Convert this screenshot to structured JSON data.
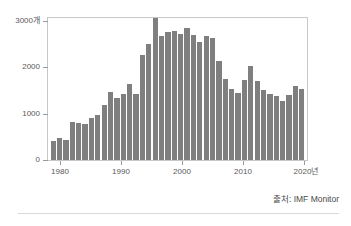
{
  "chart_data": {
    "type": "bar",
    "title": "",
    "subtitle": "",
    "xlabel": "",
    "ylabel": "",
    "y_unit_label": "3000개",
    "x_unit_label": "2020년",
    "ylim": [
      0,
      3000
    ],
    "xlim": [
      1979,
      2020
    ],
    "grid": false,
    "legend": null,
    "bar_color": "#7f7f7f",
    "categories": [
      "1980",
      "1981",
      "1982",
      "1983",
      "1984",
      "1985",
      "1986",
      "1987",
      "1988",
      "1989",
      "1990",
      "1991",
      "1992",
      "1993",
      "1994",
      "1995",
      "1996",
      "1997",
      "1998",
      "1999",
      "2000",
      "2001",
      "2002",
      "2003",
      "2004",
      "2005",
      "2006",
      "2007",
      "2008",
      "2009",
      "2010",
      "2011",
      "2012",
      "2013",
      "2014",
      "2015",
      "2016",
      "2017",
      "2018",
      "2019"
    ],
    "values": [
      400,
      470,
      430,
      800,
      790,
      760,
      880,
      950,
      1160,
      1430,
      1320,
      1400,
      1600,
      1390,
      2220,
      2460,
      2990,
      2620,
      2700,
      2730,
      2670,
      2780,
      2640,
      2500,
      2620,
      2570,
      2090,
      1720,
      1500,
      1420,
      1680,
      1990,
      1670,
      1480,
      1400,
      1350,
      1240,
      1380,
      1560,
      1490
    ],
    "y_ticks": [
      0,
      1000,
      2000,
      3000
    ],
    "y_tick_labels": [
      "0",
      "1000",
      "2000",
      "3000개"
    ],
    "x_ticks": [
      1980,
      1990,
      2000,
      2010,
      2020
    ],
    "x_tick_labels": [
      "1980",
      "1990",
      "2000",
      "2010",
      "2020년"
    ]
  },
  "source": {
    "text": "출처: IMF Monitor"
  }
}
